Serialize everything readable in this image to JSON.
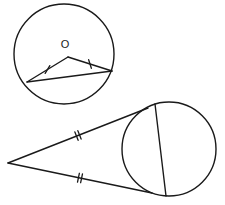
{
  "figure": {
    "background_color": "#ffffff",
    "stroke_color": "#1a1a1a"
  },
  "top_figure": {
    "name": "circle-with-isosceles-triangle",
    "circle": {
      "center_x": 64,
      "center_y": 54,
      "radius": 50
    },
    "center_label": "O",
    "center_label_x": 65,
    "center_label_y": 45,
    "apex": {
      "x": 68,
      "y": 57
    },
    "left_point": {
      "x": 27,
      "y": 82
    },
    "right_point": {
      "x": 112,
      "y": 71
    },
    "radius_left_path": "M 68 57 L 27 82",
    "radius_right_path": "M 68 57 L 112 71",
    "chord_path": "M 27 82 L 112 71",
    "tick_left": {
      "x": 47.5,
      "y": 69.5,
      "angle": 31.4
    },
    "tick_right": {
      "x": 90,
      "y": 64,
      "angle": -17.6
    },
    "tick_count_per_radius": 1,
    "tick_length": 9
  },
  "bottom_figure": {
    "name": "external-point-with-two-tangents",
    "circle": {
      "center_x": 169,
      "center_y": 149,
      "radius": 47
    },
    "external_point": {
      "x": 8,
      "y": 163
    },
    "upper_tangent_point": {
      "x": 148,
      "y": 108
    },
    "lower_tangent_point": {
      "x": 152,
      "y": 193
    },
    "upper_tangent_path": "M 8 163 L 148 108",
    "lower_tangent_path": "M 8 163 L 152 193",
    "chord_path": "M 155 104 L 166 196",
    "tick_upper": {
      "x": 78,
      "y": 135.5,
      "angle": -21.4
    },
    "tick_lower": {
      "x": 80,
      "y": 178,
      "angle": 11.8
    },
    "tick_count_per_tangent": 2,
    "tick_length": 9,
    "tick_spacing": 3.2
  }
}
